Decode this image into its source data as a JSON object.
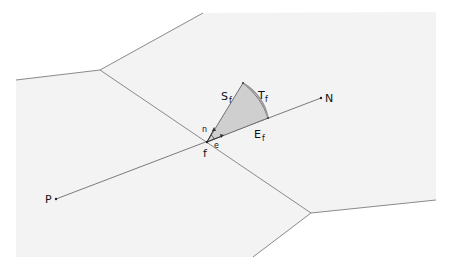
{
  "colors": {
    "background": "#ffffff",
    "cell_fill": "#f3f3f3",
    "edge": "#8a8a8a",
    "triangle_fill": "#cfcfcf",
    "triangle_stroke": "#6f6f6f",
    "label": "#111111"
  },
  "labels": {
    "P": "P",
    "N": "N",
    "f": "f",
    "n": "n",
    "e": "e",
    "S": "S",
    "S_sub": "f",
    "T": "T",
    "T_sub": "f",
    "E": "E",
    "E_sub": "f"
  },
  "geometry": {
    "cell_polygon": "16,80 100,70 203,13 436,12 436,200 311,213 253,257 16,257",
    "edges": [
      {
        "name": "edge-left",
        "x1": 16,
        "y1": 80,
        "x2": 100,
        "y2": 70
      },
      {
        "name": "edge-top",
        "x1": 100,
        "y1": 70,
        "x2": 203,
        "y2": 13
      },
      {
        "name": "edge-face",
        "x1": 100,
        "y1": 70,
        "x2": 311,
        "y2": 213
      },
      {
        "name": "edge-right",
        "x1": 311,
        "y1": 213,
        "x2": 436,
        "y2": 200
      },
      {
        "name": "edge-bottom",
        "x1": 311,
        "y1": 213,
        "x2": 253,
        "y2": 257
      }
    ],
    "PN_line": {
      "x1": 56,
      "y1": 199,
      "x2": 321,
      "y2": 98
    },
    "f_point": [
      207,
      142
    ],
    "triangle_apex": [
      243,
      83
    ],
    "triangle_right": [
      268,
      118
    ]
  }
}
